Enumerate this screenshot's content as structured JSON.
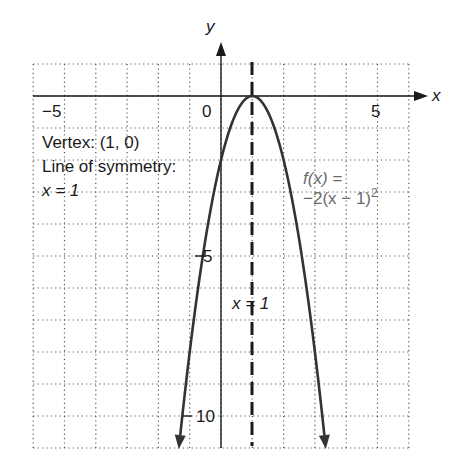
{
  "chart_data": {
    "type": "line",
    "title": "",
    "xlabel": "x",
    "ylabel": "y",
    "xlim": [
      -6,
      6
    ],
    "ylim": [
      -11,
      1
    ],
    "grid": true,
    "x_tick_labels": [
      "-5",
      "0",
      "5"
    ],
    "y_tick_labels": [
      "-5",
      "-10"
    ],
    "series": [
      {
        "name": "f(x) = -2(x - 1)^2",
        "function": "-2*(x-1)^2",
        "x": [
          -1.35,
          -1,
          0,
          1,
          2,
          3,
          3.35
        ],
        "y": [
          -11,
          -8,
          -2,
          0,
          -2,
          -8,
          -11
        ]
      }
    ],
    "reference_lines": [
      {
        "type": "vertical",
        "x": 1,
        "style": "dashed",
        "label": "x = 1"
      }
    ],
    "annotations": [
      "Vertex: (1, 0)",
      "Line of symmetry:",
      "x = 1",
      "f(x) =",
      "-2(x - 1)²"
    ]
  },
  "labels": {
    "x_axis": "x",
    "y_axis": "y",
    "tick_neg5": "−5",
    "tick_0": "0",
    "tick_5": "5",
    "tick_y_neg5": "−5",
    "tick_y_neg10": "−10",
    "vertex": "Vertex: (1, 0)",
    "symmetry_title": "Line of symmetry:",
    "symmetry_eq": "x = 1",
    "func_line1": "f(x) =",
    "func_line2": "−2(x − 1)",
    "func_exp": "2",
    "dashed_label": "x = 1"
  }
}
